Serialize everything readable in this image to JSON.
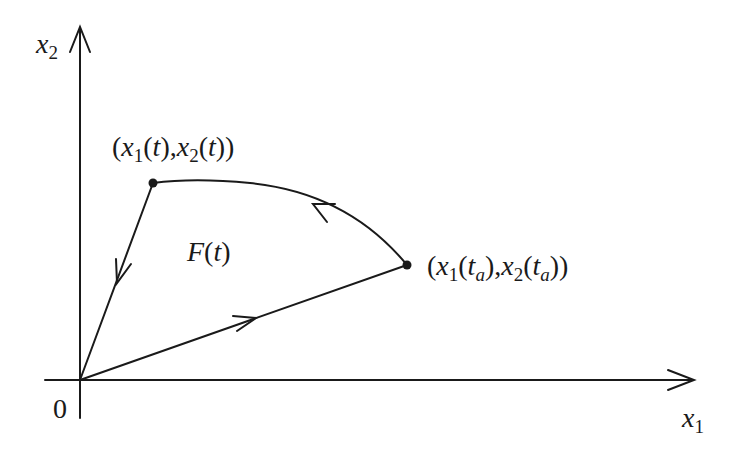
{
  "diagram": {
    "type": "phase-plane",
    "colors": {
      "stroke": "#1a1a1a",
      "background": "#ffffff"
    },
    "axes": {
      "x_label": {
        "var": "x",
        "sub": "1"
      },
      "y_label": {
        "var": "x",
        "sub": "2"
      },
      "origin_label": "0"
    },
    "points": [
      {
        "name": "current-state",
        "x1": {
          "var": "x",
          "sub": "1"
        },
        "x2": {
          "var": "x",
          "sub": "2"
        },
        "arg": "t",
        "arg_sub": ""
      },
      {
        "name": "state-at-ta",
        "x1": {
          "var": "x",
          "sub": "1"
        },
        "x2": {
          "var": "x",
          "sub": "2"
        },
        "arg": "t",
        "arg_sub": "a"
      }
    ],
    "region_label": {
      "func": "F",
      "arg": "t"
    },
    "paren_open": "(",
    "paren_close": ")",
    "comma": ","
  }
}
